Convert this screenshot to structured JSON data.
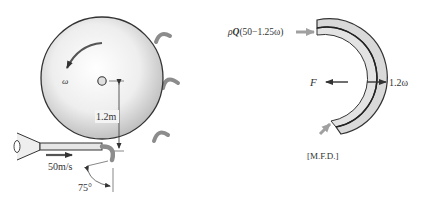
{
  "left_figure": {
    "rotation_label": "ω",
    "radius_label": "1.2m",
    "jet_velocity_label": "50m/s",
    "angle_label": "75°"
  },
  "right_figure": {
    "inflow_label_prefix": "ρ",
    "inflow_label_Q": "Q",
    "inflow_label_rest": "(50−1.25ω)",
    "force_label": "F",
    "blade_velocity_label": "1.2ω",
    "caption": "[M.F.D.]"
  },
  "colors": {
    "line": "#333333",
    "wheel_fill_light": "#ffffff",
    "wheel_fill_dark": "#c8c8c8",
    "blade_fill": "#d9d9d9",
    "bucket_gray": "#8c8c8c",
    "arrow_gray": "#a0a0a0"
  }
}
